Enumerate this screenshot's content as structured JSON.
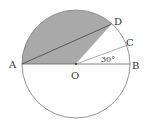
{
  "diagram": {
    "labels": {
      "A": "A",
      "B": "B",
      "C": "C",
      "D": "D",
      "O": "O"
    },
    "angle_label": "30°",
    "colors": {
      "shade": "#a9a9a9",
      "stroke": "#666666",
      "line": "#555555"
    }
  }
}
